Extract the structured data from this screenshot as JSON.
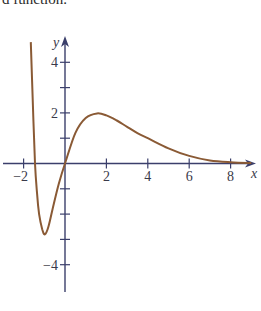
{
  "caption": {
    "partial_text": "d function."
  },
  "colors": {
    "axis": "#3b3f6b",
    "curve": "#8a5a35",
    "text": "#3a3a4a"
  },
  "chart_data": {
    "type": "line",
    "title": "",
    "xlabel": "x",
    "ylabel": "y",
    "xlim": [
      -3,
      9.3
    ],
    "ylim": [
      -5,
      5
    ],
    "grid": false,
    "x_ticks": [
      -2,
      0,
      2,
      4,
      6,
      8
    ],
    "x_tick_labels": [
      "-2",
      "",
      "2",
      "4",
      "6",
      "8"
    ],
    "y_ticks": [
      -4,
      -3,
      -2,
      -1,
      1,
      2,
      3,
      4
    ],
    "y_tick_labels": [
      "-4",
      "",
      "",
      "",
      "",
      "2",
      "",
      "4"
    ],
    "series": [
      {
        "name": "f(x)",
        "x": [
          -1.65,
          -1.55,
          -1.45,
          -1.35,
          -1.25,
          -1.1,
          -0.97,
          -0.8,
          -0.6,
          -0.3,
          0,
          0.5,
          1.0,
          1.55,
          2.0,
          2.5,
          3.0,
          3.5,
          4.0,
          5.0,
          6.0,
          7.0,
          8.0,
          9.0
        ],
        "y": [
          4.8,
          2.3,
          0,
          -1.2,
          -2.0,
          -2.6,
          -2.8,
          -2.5,
          -1.8,
          -0.8,
          0,
          1.2,
          1.8,
          1.98,
          1.9,
          1.7,
          1.45,
          1.2,
          1.0,
          0.6,
          0.3,
          0.12,
          0.05,
          0.02
        ]
      }
    ]
  }
}
